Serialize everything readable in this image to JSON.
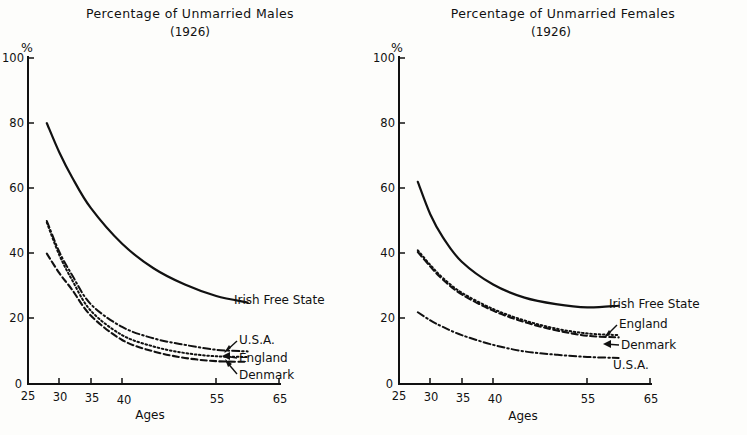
{
  "figure": {
    "page_background": "#fdfdfb",
    "ink_color": "#111111"
  },
  "chart_data": [
    {
      "type": "line",
      "panel": "left",
      "title": "Percentage of Unmarried Males",
      "subtitle": "(1926)",
      "xlabel": "Ages",
      "ylabel": "%",
      "xlim": [
        25,
        65
      ],
      "ylim": [
        0,
        100
      ],
      "xticks": [
        25,
        30,
        35,
        40,
        55,
        65
      ],
      "yticks": [
        0,
        20,
        40,
        60,
        80,
        100
      ],
      "grid": false,
      "legend_position": "right-inline",
      "x": [
        28,
        30,
        32,
        35,
        40,
        45,
        50,
        55,
        60
      ],
      "series": [
        {
          "name": "Irish Free State",
          "style": "solid",
          "values": [
            80,
            71,
            63.5,
            54,
            43,
            35.5,
            30.5,
            27,
            25
          ]
        },
        {
          "name": "U.S.A.",
          "style": "dash-dot",
          "values": [
            50,
            40.5,
            33.5,
            24.5,
            17.5,
            14,
            12,
            10.5,
            10
          ]
        },
        {
          "name": "England",
          "style": "dotted",
          "values": [
            49.5,
            39.5,
            32,
            22.5,
            15,
            11.5,
            9.5,
            8.5,
            8.3
          ]
        },
        {
          "name": "Denmark",
          "style": "dashed",
          "values": [
            40,
            34,
            29,
            21,
            13.5,
            10,
            8,
            7,
            6.8
          ]
        }
      ]
    },
    {
      "type": "line",
      "panel": "right",
      "title": "Percentage of Unmarried Females",
      "subtitle": "(1926)",
      "xlabel": "Ages",
      "ylabel": "%",
      "xlim": [
        25,
        65
      ],
      "ylim": [
        0,
        100
      ],
      "xticks": [
        25,
        30,
        35,
        40,
        55,
        65
      ],
      "yticks": [
        0,
        20,
        40,
        60,
        80,
        100
      ],
      "grid": false,
      "legend_position": "right-inline",
      "x": [
        28,
        30,
        32,
        35,
        40,
        45,
        50,
        55,
        60
      ],
      "series": [
        {
          "name": "Irish Free State",
          "style": "solid",
          "values": [
            62,
            52,
            45,
            37.5,
            30.5,
            26.5,
            24.5,
            23.5,
            24
          ]
        },
        {
          "name": "England",
          "style": "dotted",
          "values": [
            41,
            36.5,
            32.5,
            28,
            23,
            19.5,
            17,
            15.5,
            15
          ]
        },
        {
          "name": "Denmark",
          "style": "dashed",
          "values": [
            40.5,
            36,
            32,
            27.5,
            22.5,
            19,
            16.5,
            14.8,
            14.3
          ]
        },
        {
          "name": "U.S.A.",
          "style": "dash-dot",
          "values": [
            22,
            19.5,
            17.5,
            15,
            12,
            10,
            9,
            8.3,
            8
          ]
        }
      ]
    }
  ],
  "left_panel": {
    "title": "Percentage of Unmarried Males",
    "subtitle": "(1926)",
    "y_axis_unit": "%",
    "x_axis_name": "Ages",
    "yticks": [
      "100",
      "80",
      "60",
      "40",
      "20",
      "0"
    ],
    "xticks": [
      "25",
      "30",
      "35",
      "40",
      "55",
      "65"
    ],
    "legend": [
      {
        "label": "Irish Free State",
        "style": "solid",
        "has_arrow": false
      },
      {
        "label": "U.S.A.",
        "style": "dash-dot",
        "has_arrow": true
      },
      {
        "label": "England",
        "style": "dotted",
        "has_arrow": true
      },
      {
        "label": "Denmark",
        "style": "dashed",
        "has_arrow": true
      }
    ]
  },
  "right_panel": {
    "title": "Percentage of Unmarried Females",
    "subtitle": "(1926)",
    "y_axis_unit": "%",
    "x_axis_name": "Ages",
    "yticks": [
      "100",
      "80",
      "60",
      "40",
      "20",
      "0"
    ],
    "xticks": [
      "25",
      "30",
      "35",
      "40",
      "55",
      "65"
    ],
    "legend": [
      {
        "label": "Irish Free State",
        "style": "solid",
        "has_arrow": false
      },
      {
        "label": "England",
        "style": "dotted",
        "has_arrow": true
      },
      {
        "label": "Denmark",
        "style": "dashed",
        "has_arrow": true
      },
      {
        "label": "U.S.A.",
        "style": "dash-dot",
        "has_arrow": false
      }
    ]
  }
}
